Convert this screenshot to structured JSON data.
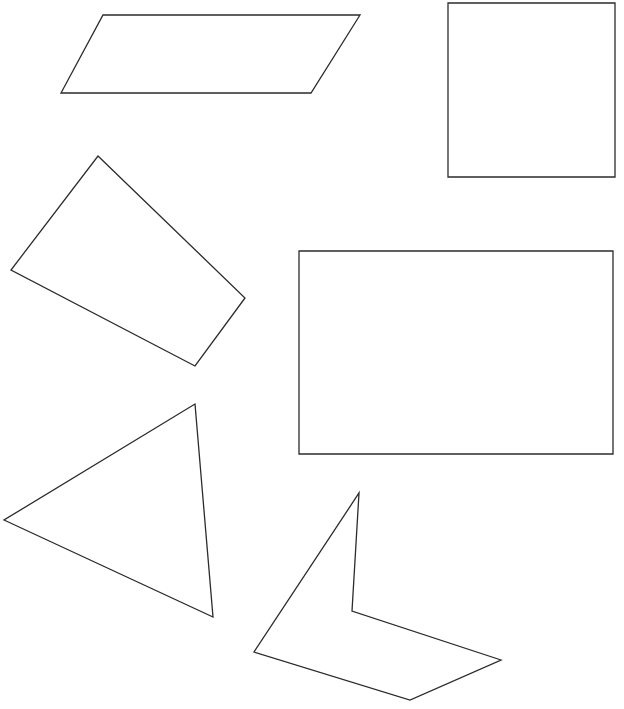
{
  "canvas": {
    "width": 624,
    "height": 709,
    "background": "#ffffff",
    "stroke_color": "#2b2b2b"
  },
  "shapes": [
    {
      "id": "parallelogram",
      "type": "parallelogram",
      "points": [
        [
          103,
          15
        ],
        [
          360,
          15
        ],
        [
          311,
          93
        ],
        [
          61,
          93
        ]
      ]
    },
    {
      "id": "square",
      "type": "square",
      "points": [
        [
          448,
          3
        ],
        [
          615,
          3
        ],
        [
          615,
          177
        ],
        [
          448,
          177
        ]
      ]
    },
    {
      "id": "quadrilateral",
      "type": "quadrilateral",
      "points": [
        [
          98,
          156
        ],
        [
          245,
          298
        ],
        [
          195,
          366
        ],
        [
          11,
          270
        ]
      ]
    },
    {
      "id": "rectangle",
      "type": "rectangle",
      "points": [
        [
          299,
          251
        ],
        [
          613,
          251
        ],
        [
          613,
          454
        ],
        [
          299,
          454
        ]
      ]
    },
    {
      "id": "triangle",
      "type": "triangle",
      "points": [
        [
          195,
          404
        ],
        [
          213,
          617
        ],
        [
          4,
          520
        ]
      ]
    },
    {
      "id": "concave-quadrilateral",
      "type": "concave-polygon",
      "points": [
        [
          359,
          493
        ],
        [
          352,
          611
        ],
        [
          501,
          660
        ],
        [
          410,
          700
        ],
        [
          254,
          652
        ]
      ]
    }
  ]
}
